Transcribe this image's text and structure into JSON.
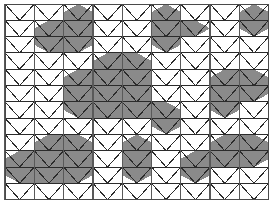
{
  "figure": {
    "type": "geometric-pattern",
    "width": 269,
    "height": 203,
    "background_color": "#ffffff",
    "line_color": "#2b2b2b",
    "vertical_line_color": "#595959",
    "shade_color": "#8a8a8a",
    "shade_opacity": 0.95,
    "border_color": "#4a4a4a",
    "line_width": 1.0,
    "vertical_line_width": 1.3
  },
  "grid": {
    "origin_x": 5,
    "origin_y": 4,
    "cell_width": 29.3,
    "row_height": 16.3,
    "columns": 9,
    "rows": 12,
    "description": "Isometric triangular lattice: horizontal rails every row_height, diagonals forming upward and downward triangles, plus full-height vertical lines at each column boundary."
  },
  "shaded_cells": [
    {
      "col": 2,
      "row": 0,
      "kind": "rhombus-down"
    },
    {
      "col": 2,
      "row": 1,
      "kind": "rhombus-down"
    },
    {
      "col": 2,
      "row": 2,
      "kind": "rhombus-down"
    },
    {
      "col": 1,
      "row": 1,
      "kind": "rhombus-up"
    },
    {
      "col": 1,
      "row": 2,
      "kind": "rhombus-up"
    },
    {
      "col": 5,
      "row": 0,
      "kind": "rhombus-down"
    },
    {
      "col": 5,
      "row": 1,
      "kind": "rhombus-down"
    },
    {
      "col": 5,
      "row": 2,
      "kind": "rhombus-down"
    },
    {
      "col": 6,
      "row": 1,
      "kind": "rhombus-up"
    },
    {
      "col": 8,
      "row": 0,
      "kind": "rhombus-down"
    },
    {
      "col": 8,
      "row": 1,
      "kind": "rhombus-down"
    },
    {
      "col": 3,
      "row": 3,
      "kind": "rhombus-down"
    },
    {
      "col": 4,
      "row": 3,
      "kind": "rhombus-down"
    },
    {
      "col": 3,
      "row": 4,
      "kind": "rhombus-down"
    },
    {
      "col": 4,
      "row": 4,
      "kind": "rhombus-down"
    },
    {
      "col": 2,
      "row": 4,
      "kind": "rhombus-up"
    },
    {
      "col": 2,
      "row": 5,
      "kind": "rhombus-up"
    },
    {
      "col": 3,
      "row": 5,
      "kind": "rhombus-up"
    },
    {
      "col": 4,
      "row": 5,
      "kind": "rhombus-up"
    },
    {
      "col": 2,
      "row": 6,
      "kind": "rhombus-up"
    },
    {
      "col": 3,
      "row": 6,
      "kind": "rhombus-up"
    },
    {
      "col": 4,
      "row": 6,
      "kind": "rhombus-up"
    },
    {
      "col": 7,
      "row": 4,
      "kind": "rhombus-down"
    },
    {
      "col": 8,
      "row": 4,
      "kind": "rhombus-down"
    },
    {
      "col": 7,
      "row": 5,
      "kind": "rhombus-down"
    },
    {
      "col": 8,
      "row": 5,
      "kind": "rhombus-down"
    },
    {
      "col": 7,
      "row": 6,
      "kind": "rhombus-down"
    },
    {
      "col": 5,
      "row": 6,
      "kind": "rhombus-up"
    },
    {
      "col": 5,
      "row": 7,
      "kind": "rhombus-up"
    },
    {
      "col": 1,
      "row": 8,
      "kind": "rhombus-down"
    },
    {
      "col": 2,
      "row": 8,
      "kind": "rhombus-down"
    },
    {
      "col": 1,
      "row": 9,
      "kind": "rhombus-down"
    },
    {
      "col": 2,
      "row": 9,
      "kind": "rhombus-down"
    },
    {
      "col": 1,
      "row": 10,
      "kind": "rhombus-down"
    },
    {
      "col": 2,
      "row": 10,
      "kind": "rhombus-down"
    },
    {
      "col": 0,
      "row": 9,
      "kind": "rhombus-up"
    },
    {
      "col": 0,
      "row": 10,
      "kind": "rhombus-up"
    },
    {
      "col": 4,
      "row": 8,
      "kind": "rhombus-down"
    },
    {
      "col": 4,
      "row": 9,
      "kind": "rhombus-down"
    },
    {
      "col": 4,
      "row": 10,
      "kind": "rhombus-down"
    },
    {
      "col": 7,
      "row": 8,
      "kind": "rhombus-down"
    },
    {
      "col": 8,
      "row": 8,
      "kind": "rhombus-down"
    },
    {
      "col": 7,
      "row": 9,
      "kind": "rhombus-down"
    },
    {
      "col": 8,
      "row": 9,
      "kind": "rhombus-down"
    },
    {
      "col": 6,
      "row": 9,
      "kind": "rhombus-up"
    },
    {
      "col": 6,
      "row": 10,
      "kind": "rhombus-up"
    }
  ],
  "legend": {
    "shaded_label": "shaded region",
    "unshaded_label": "empty region"
  }
}
